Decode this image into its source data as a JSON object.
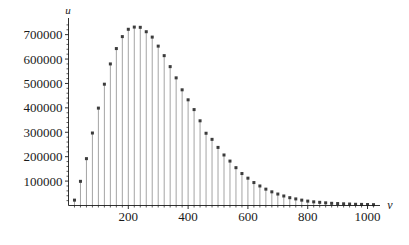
{
  "chart_data": {
    "type": "bar",
    "style": "stem-plot-with-square-markers",
    "title": "",
    "subtitle": "",
    "xlabel": "ν",
    "ylabel": "u",
    "legend": [],
    "grid": false,
    "xlim": [
      0,
      1035
    ],
    "ylim": [
      0,
      760000
    ],
    "xticks": [
      200,
      400,
      600,
      800,
      1000
    ],
    "xtick_labels": [
      "200",
      "400",
      "600",
      "800",
      "1000"
    ],
    "x_minor_tick_step": 20,
    "yticks": [
      100000,
      200000,
      300000,
      400000,
      500000,
      600000,
      700000
    ],
    "ytick_labels": [
      "100000",
      "200000",
      "300000",
      "400000",
      "500000",
      "600000",
      "700000"
    ],
    "y_minor_tick_step": 20000,
    "axis_color": "#1a1a1a",
    "stem_color": "#9a9a9a",
    "marker_color": "#3c3c3c",
    "background": "#ffffff",
    "x": [
      20,
      40,
      60,
      80,
      100,
      120,
      140,
      160,
      180,
      200,
      220,
      240,
      260,
      280,
      300,
      320,
      340,
      360,
      380,
      400,
      420,
      440,
      460,
      480,
      500,
      520,
      540,
      560,
      580,
      600,
      620,
      640,
      660,
      680,
      700,
      720,
      740,
      760,
      780,
      800,
      820,
      840,
      860,
      880,
      900,
      920,
      940,
      960,
      980,
      1000,
      1020
    ],
    "values": [
      22000,
      99000,
      192000,
      297000,
      399000,
      497000,
      580000,
      643000,
      692000,
      722000,
      731000,
      730000,
      712000,
      690000,
      653000,
      614000,
      569000,
      523000,
      474000,
      433000,
      393000,
      347000,
      296000,
      271000,
      238000,
      207000,
      182000,
      155000,
      131000,
      112000,
      94000,
      80000,
      67000,
      56000,
      47000,
      39000,
      32000,
      27000,
      22000,
      18000,
      15000,
      13000,
      11000,
      9000,
      8000,
      7000,
      6000,
      5000,
      4500,
      4000,
      3500
    ]
  },
  "axis_labels": {
    "x_axis_symbol": "ν",
    "y_axis_symbol": "u"
  }
}
